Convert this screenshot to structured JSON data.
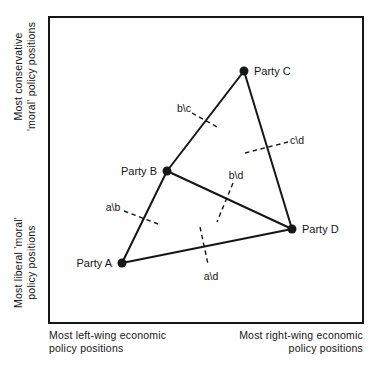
{
  "figure": {
    "colors": {
      "ink": "#161616",
      "background": "#fefefe"
    },
    "axes": {
      "y_top": {
        "line1": "Most conservative",
        "line2": "'moral' policy positions"
      },
      "y_bottom": {
        "line1": "Most liberal 'moral'",
        "line2": "policy positions"
      },
      "x_left": {
        "line1": "Most left-wing economic",
        "line2": "policy positions"
      },
      "x_right": {
        "line1": "Most right-wing economic",
        "line2": "policy positions"
      }
    },
    "box": {
      "x": 49,
      "y": 17,
      "width": 314,
      "height": 306
    },
    "parties": [
      {
        "id": "A",
        "label": "Party A",
        "x": 122,
        "y": 263,
        "label_side": "left"
      },
      {
        "id": "B",
        "label": "Party B",
        "x": 167,
        "y": 171,
        "label_side": "left"
      },
      {
        "id": "C",
        "label": "Party C",
        "x": 244,
        "y": 71,
        "label_side": "right"
      },
      {
        "id": "D",
        "label": "Party D",
        "x": 292,
        "y": 229,
        "label_side": "right"
      }
    ],
    "edges": [
      {
        "from": "A",
        "to": "B"
      },
      {
        "from": "B",
        "to": "C"
      },
      {
        "from": "C",
        "to": "D"
      },
      {
        "from": "A",
        "to": "D"
      },
      {
        "from": "B",
        "to": "D"
      }
    ],
    "cleavages": [
      {
        "id": "ab",
        "label": "a\\b",
        "x1": 124,
        "y1": 211,
        "x2": 158,
        "y2": 224,
        "lx": 113,
        "ly": 207
      },
      {
        "id": "bc",
        "label": "b\\c",
        "x1": 192,
        "y1": 113,
        "x2": 219,
        "y2": 128,
        "lx": 184,
        "ly": 108
      },
      {
        "id": "cd",
        "label": "c\\d",
        "x1": 245,
        "y1": 153,
        "x2": 288,
        "y2": 142,
        "lx": 297,
        "ly": 140
      },
      {
        "id": "bd",
        "label": "b\\d",
        "x1": 233,
        "y1": 183,
        "x2": 217,
        "y2": 222,
        "lx": 236,
        "ly": 175
      },
      {
        "id": "ad",
        "label": "a\\d",
        "x1": 200,
        "y1": 227,
        "x2": 208,
        "y2": 264,
        "lx": 211,
        "ly": 276
      }
    ]
  }
}
